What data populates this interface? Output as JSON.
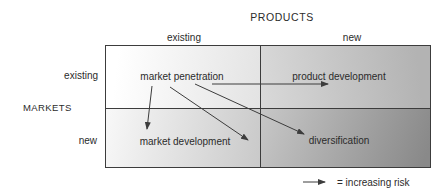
{
  "figure": {
    "title": "PRODUCTS",
    "side_title": "MARKETS",
    "column_headers": [
      "existing",
      "new"
    ],
    "row_headers": [
      "existing",
      "new"
    ],
    "quadrants": [
      {
        "id": "market-penetration",
        "row": "existing",
        "column": "existing",
        "label": "market penetration"
      },
      {
        "id": "product-development",
        "row": "existing",
        "column": "new",
        "label": "product development"
      },
      {
        "id": "market-development",
        "row": "new",
        "column": "existing",
        "label": "market development"
      },
      {
        "id": "diversification",
        "row": "new",
        "column": "new",
        "label": "diversification"
      }
    ],
    "legend": {
      "symbol": "right-arrow",
      "text": "= increasing risk"
    }
  },
  "arrows": [
    {
      "name": "penetration-to-market-development",
      "from": "market penetration",
      "to": "market development",
      "x1": 152,
      "y1": 86,
      "x2": 147,
      "y2": 129
    },
    {
      "name": "penetration-to-market-development-2",
      "from": "market penetration",
      "to": "market development (right)",
      "x1": 170,
      "y1": 87,
      "x2": 248,
      "y2": 140
    },
    {
      "name": "penetration-to-diversification",
      "from": "market penetration",
      "to": "diversification",
      "x1": 195,
      "y1": 84,
      "x2": 304,
      "y2": 134
    },
    {
      "name": "penetration-to-product-development",
      "from": "market penetration",
      "to": "product development",
      "x1": 212,
      "y1": 84,
      "x2": 328,
      "y2": 84
    },
    {
      "name": "legend-increasing-risk-arrow",
      "from": "legend",
      "to": "legend",
      "x1": 303,
      "y1": 182,
      "x2": 325,
      "y2": 182
    }
  ],
  "colors": {
    "line": "#3c3c3c",
    "text": "#2b2b2b",
    "shade_light": "#ffffff",
    "shade_dark": "#898989"
  }
}
